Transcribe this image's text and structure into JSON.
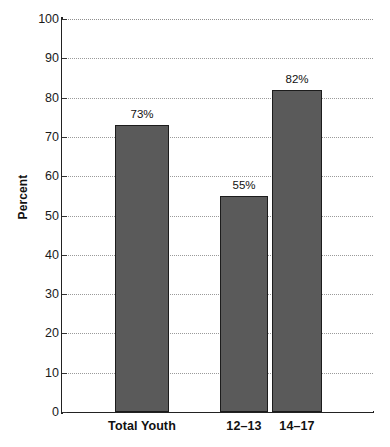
{
  "chart_data": {
    "type": "bar",
    "title": "",
    "subtitle": "",
    "xlabel": "",
    "ylabel": "Percent",
    "categories": [
      "Total Youth",
      "12–13",
      "14–17"
    ],
    "values": [
      73,
      55,
      82
    ],
    "value_labels": [
      "73%",
      "55%",
      "82%"
    ],
    "ylim": [
      0,
      100
    ],
    "ytick_step": 10,
    "ytick_labels": [
      "100",
      "90",
      "80",
      "70",
      "60",
      "50",
      "40",
      "30",
      "20",
      "10",
      "0"
    ],
    "ytick_values": [
      100,
      90,
      80,
      70,
      60,
      50,
      40,
      30,
      20,
      10,
      0
    ],
    "grid": true,
    "grid_axis": "y",
    "grid_style": "dotted",
    "legend": false,
    "legend_position": "none",
    "series": [
      {
        "name": "Percent",
        "values": [
          73,
          55,
          82
        ]
      }
    ],
    "colors": {
      "bar_fill": "#5a5a5a",
      "bar_border": "#1c1c1c",
      "axis": "#222222",
      "gridline": "#9a9a9a",
      "text": "#111111",
      "background": "#ffffff"
    },
    "bar_geometry": [
      {
        "category": "Total Youth",
        "left_px": 115,
        "width_px": 54
      },
      {
        "category": "12–13",
        "left_px": 220,
        "width_px": 48
      },
      {
        "category": "14–17",
        "left_px": 272,
        "width_px": 50
      }
    ],
    "label_geometry": [
      {
        "category": "Total Youth",
        "center_px": 142
      },
      {
        "category": "12–13",
        "center_px": 244
      },
      {
        "category": "14–17",
        "center_px": 297
      }
    ]
  }
}
